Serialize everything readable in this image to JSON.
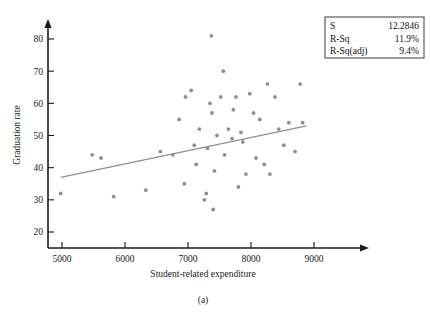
{
  "chart_data": {
    "type": "scatter",
    "title": "",
    "caption": "(a)",
    "xlabel": "Student-related expenditure",
    "ylabel": "Graduation rate",
    "xlim": [
      4600,
      9400
    ],
    "ylim": [
      17,
      84
    ],
    "xticks": [
      5000,
      6000,
      7000,
      8000,
      9000
    ],
    "yticks": [
      20,
      30,
      40,
      50,
      60,
      70,
      80
    ],
    "grid": false,
    "legend": "none",
    "point_color": "#8e8e8e",
    "line_color": "#8e8e8e",
    "points": [
      {
        "x": 4980,
        "y": 32
      },
      {
        "x": 5480,
        "y": 44
      },
      {
        "x": 5620,
        "y": 43
      },
      {
        "x": 5820,
        "y": 31
      },
      {
        "x": 6330,
        "y": 33
      },
      {
        "x": 6560,
        "y": 45
      },
      {
        "x": 6760,
        "y": 44
      },
      {
        "x": 6860,
        "y": 55
      },
      {
        "x": 6940,
        "y": 35
      },
      {
        "x": 6960,
        "y": 62
      },
      {
        "x": 7050,
        "y": 64
      },
      {
        "x": 7100,
        "y": 47
      },
      {
        "x": 7130,
        "y": 41
      },
      {
        "x": 7180,
        "y": 52
      },
      {
        "x": 7260,
        "y": 30
      },
      {
        "x": 7290,
        "y": 32
      },
      {
        "x": 7310,
        "y": 46
      },
      {
        "x": 7350,
        "y": 60
      },
      {
        "x": 7370,
        "y": 81
      },
      {
        "x": 7380,
        "y": 57
      },
      {
        "x": 7400,
        "y": 27
      },
      {
        "x": 7420,
        "y": 39
      },
      {
        "x": 7460,
        "y": 50
      },
      {
        "x": 7520,
        "y": 62
      },
      {
        "x": 7560,
        "y": 70
      },
      {
        "x": 7580,
        "y": 44
      },
      {
        "x": 7640,
        "y": 52
      },
      {
        "x": 7700,
        "y": 49
      },
      {
        "x": 7720,
        "y": 58
      },
      {
        "x": 7760,
        "y": 62
      },
      {
        "x": 7800,
        "y": 34
      },
      {
        "x": 7840,
        "y": 51
      },
      {
        "x": 7870,
        "y": 48
      },
      {
        "x": 7920,
        "y": 38
      },
      {
        "x": 7980,
        "y": 63
      },
      {
        "x": 8040,
        "y": 57
      },
      {
        "x": 8080,
        "y": 43
      },
      {
        "x": 8140,
        "y": 55
      },
      {
        "x": 8210,
        "y": 41
      },
      {
        "x": 8260,
        "y": 66
      },
      {
        "x": 8300,
        "y": 38
      },
      {
        "x": 8380,
        "y": 62
      },
      {
        "x": 8440,
        "y": 52
      },
      {
        "x": 8520,
        "y": 47
      },
      {
        "x": 8600,
        "y": 54
      },
      {
        "x": 8700,
        "y": 45
      },
      {
        "x": 8780,
        "y": 66
      },
      {
        "x": 8820,
        "y": 54
      }
    ],
    "fit_line": {
      "x1": 4980,
      "y1": 37.0,
      "x2": 8880,
      "y2": 53.0
    }
  },
  "stats_box": {
    "rows": [
      {
        "label": "S",
        "value": "12.2846"
      },
      {
        "label": "R-Sq",
        "value": "11.9%"
      },
      {
        "label": "R-Sq(adj)",
        "value": "9.4%"
      }
    ]
  }
}
